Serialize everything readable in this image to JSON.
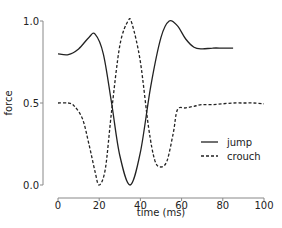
{
  "chart_data": {
    "type": "line",
    "title": "",
    "xlabel": "time (ms)",
    "ylabel": "force",
    "xlim": [
      0,
      100
    ],
    "ylim": [
      0,
      1.0
    ],
    "xticks": [
      "0",
      "20",
      "40",
      "60",
      "80",
      "100"
    ],
    "yticks": [
      "0.0",
      "0.5",
      "1.0"
    ],
    "grid": false,
    "legend_position": "center right",
    "series": [
      {
        "name": "jump",
        "style": "solid",
        "x": [
          0,
          5,
          10,
          15,
          18,
          22,
          26,
          30,
          35,
          40,
          45,
          50,
          54,
          58,
          62,
          66,
          70,
          75,
          80,
          85
        ],
        "values": [
          0.8,
          0.795,
          0.83,
          0.9,
          0.92,
          0.8,
          0.5,
          0.18,
          0.0,
          0.2,
          0.6,
          0.9,
          1.0,
          0.97,
          0.89,
          0.84,
          0.83,
          0.835,
          0.835,
          0.835
        ]
      },
      {
        "name": "crouch",
        "style": "dashed",
        "x": [
          0,
          5,
          8,
          12,
          15,
          18,
          20,
          23,
          26,
          30,
          34,
          36,
          40,
          44,
          47,
          50,
          53,
          56,
          58,
          62,
          66,
          70,
          75,
          80,
          85,
          90,
          95,
          100
        ],
        "values": [
          0.5,
          0.5,
          0.48,
          0.4,
          0.25,
          0.08,
          0.0,
          0.1,
          0.45,
          0.85,
          1.0,
          0.98,
          0.75,
          0.35,
          0.15,
          0.11,
          0.15,
          0.32,
          0.46,
          0.47,
          0.48,
          0.49,
          0.49,
          0.495,
          0.5,
          0.5,
          0.5,
          0.495
        ]
      }
    ]
  }
}
